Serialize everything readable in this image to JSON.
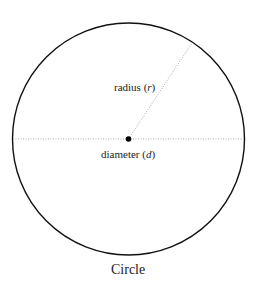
{
  "diagram": {
    "title": "Circle",
    "labels": {
      "radius": "radius",
      "radius_symbol": "r",
      "diameter": "diameter",
      "diameter_symbol": "d"
    },
    "colors": {
      "circle": "#111111",
      "guide_lines": "#aaaaaa",
      "center_point": "#000000"
    }
  }
}
